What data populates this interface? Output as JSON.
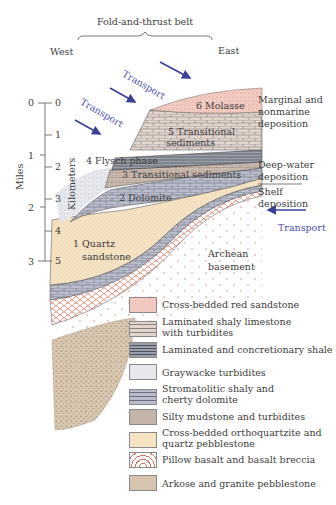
{
  "header": {
    "title": "Fold-and-thrust belt",
    "west": "West",
    "east": "East"
  },
  "scale": {
    "miles_label": "Miles",
    "km_label": "Kilometers",
    "miles_ticks": [
      "0",
      "1",
      "2",
      "3"
    ],
    "km_ticks": [
      "0",
      "1",
      "2",
      "3",
      "4",
      "5"
    ]
  },
  "transport_labels": {
    "upper": "Transport",
    "middle": "Transport",
    "right": "Transport"
  },
  "units": {
    "u6": "6 Molasse",
    "u5_line1": "5 Transitional",
    "u5_line2": "sediments",
    "u4": "4 Flysch phase",
    "u3": "3 Transitional sediments",
    "u2": "2 Dolomite",
    "u1_line1": "1 Quartz",
    "u1_line2": "sandstone",
    "basement_line1": "Archean",
    "basement_line2": "basement"
  },
  "environments": {
    "marginal_line1": "Marginal and",
    "marginal_line2": "nonmarine",
    "marginal_line3": "deposition",
    "deep_line1": "Deep-water",
    "deep_line2": "deposition",
    "shelf_line1": "Shelf",
    "shelf_line2": "deposition"
  },
  "legend": [
    {
      "line1": "Cross-bedded red sandstone",
      "line2": "",
      "pattern": "red-sandstone",
      "color": "#f2c9c0"
    },
    {
      "line1": "Laminated shaly limestone",
      "line2": "with turbidites",
      "pattern": "shaly-limestone",
      "color": "#e0d4cc"
    },
    {
      "line1": "Laminated and concretionary shale",
      "line2": "",
      "pattern": "shale",
      "color": "#8c8f98"
    },
    {
      "line1": "Graywacke turbidites",
      "line2": "",
      "pattern": "graywacke",
      "color": "#e6e8ee"
    },
    {
      "line1": "Stromatolitic shaly and",
      "line2": "cherty dolomite",
      "pattern": "dolomite",
      "color": "#b8bccb"
    },
    {
      "line1": "Silty mudstone and turbidites",
      "line2": "",
      "pattern": "mudstone",
      "color": "#c4b4aa"
    },
    {
      "line1": "Cross-bedded orthoquartzite and",
      "line2": "quartz pebblestone",
      "pattern": "orthoquartzite",
      "color": "#f6e3c4"
    },
    {
      "line1": "Pillow basalt and basalt breccia",
      "line2": "",
      "pattern": "pillow-basalt",
      "color": "#ffffff"
    },
    {
      "line1": "Arkose and granite pebblestone",
      "line2": "",
      "pattern": "arkose",
      "color": "#d6c4ae"
    }
  ]
}
